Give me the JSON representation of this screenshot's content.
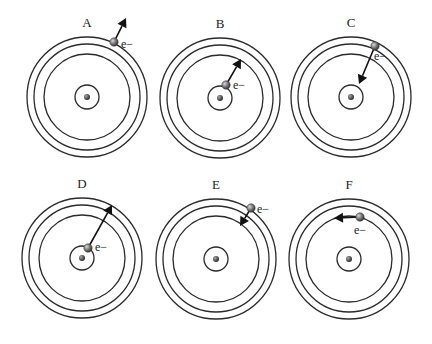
{
  "colors": {
    "orbit": "#2a2a2a",
    "nucleus": "#555555",
    "electron": "#6b6b6b",
    "arrow": "#111111",
    "background": "#ffffff"
  },
  "orbit_radii": [
    12,
    43,
    53,
    60
  ],
  "electron_label": "e−",
  "panels": [
    {
      "label": "A",
      "cx": 87,
      "cy": 97,
      "electron": {
        "x": 114,
        "y": 42
      },
      "arrow_to": {
        "x": 126,
        "y": 18
      },
      "label_pos": {
        "x": 87,
        "y": 27
      },
      "elabel_pos": {
        "x": 121,
        "y": 48
      },
      "description": "electron leaves outermost orbit (ionization)"
    },
    {
      "label": "B",
      "cx": 220,
      "cy": 98,
      "electron": {
        "x": 226,
        "y": 85
      },
      "arrow_to": {
        "x": 241,
        "y": 59
      },
      "label_pos": {
        "x": 220,
        "y": 28
      },
      "elabel_pos": {
        "x": 233,
        "y": 89
      },
      "description": "electron moves from orbit 1 to orbit 2"
    },
    {
      "label": "C",
      "cx": 351,
      "cy": 97,
      "electron": {
        "x": 375,
        "y": 46
      },
      "arrow_to": {
        "x": 359,
        "y": 84
      },
      "label_pos": {
        "x": 351,
        "y": 27
      },
      "elabel_pos": {
        "x": 374,
        "y": 60
      },
      "description": "electron moves from orbit 3 to orbit 1"
    },
    {
      "label": "D",
      "cx": 82,
      "cy": 258,
      "electron": {
        "x": 88,
        "y": 248
      },
      "arrow_to": {
        "x": 112,
        "y": 205
      },
      "label_pos": {
        "x": 82,
        "y": 188
      },
      "elabel_pos": {
        "x": 95,
        "y": 251
      },
      "description": "electron moves from orbit 1 to orbit 3"
    },
    {
      "label": "E",
      "cx": 216,
      "cy": 259,
      "electron": {
        "x": 251,
        "y": 208
      },
      "arrow_to": {
        "x": 240,
        "y": 226
      },
      "label_pos": {
        "x": 216,
        "y": 189
      },
      "elabel_pos": {
        "x": 257,
        "y": 213
      },
      "description": "electron moves from orbit 4 to orbit 2"
    },
    {
      "label": "F",
      "cx": 349,
      "cy": 259,
      "electron": {
        "x": 360,
        "y": 217
      },
      "arrow_to": {
        "x": 334,
        "y": 218
      },
      "label_pos": {
        "x": 349,
        "y": 189
      },
      "elabel_pos": {
        "x": 354,
        "y": 234
      },
      "description": "electron moves along orbit 2 (no transition)"
    }
  ]
}
